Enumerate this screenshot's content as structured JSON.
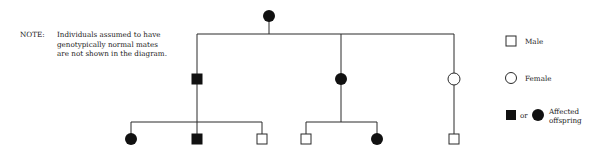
{
  "note": {
    "label": "NOTE:",
    "lines": [
      "Individuals assumed to have",
      "genotypically normal mates",
      "are not shown in the diagram."
    ]
  },
  "legend": {
    "male": "Male",
    "female": "Female",
    "or": "or",
    "affected_line1": "Affected",
    "affected_line2": "offspring"
  },
  "pedigree": {
    "generation_1": [
      {
        "id": "I-1",
        "sex": "female",
        "affected": true
      }
    ],
    "generation_2": [
      {
        "id": "II-1",
        "sex": "male",
        "affected": true
      },
      {
        "id": "II-2",
        "sex": "female",
        "affected": true
      },
      {
        "id": "II-3",
        "sex": "female",
        "affected": false
      }
    ],
    "generation_3": [
      {
        "id": "III-1",
        "parent": "II-1",
        "sex": "female",
        "affected": true
      },
      {
        "id": "III-2",
        "parent": "II-1",
        "sex": "male",
        "affected": true
      },
      {
        "id": "III-3",
        "parent": "II-1",
        "sex": "male",
        "affected": false
      },
      {
        "id": "III-4",
        "parent": "II-2",
        "sex": "male",
        "affected": false
      },
      {
        "id": "III-5",
        "parent": "II-2",
        "sex": "female",
        "affected": true
      },
      {
        "id": "III-6",
        "parent": "II-3",
        "sex": "male",
        "affected": false
      }
    ]
  },
  "colors": {
    "line": "#2a2a2a",
    "affected_fill": "#111111",
    "unaffected_fill": "#ffffff"
  }
}
